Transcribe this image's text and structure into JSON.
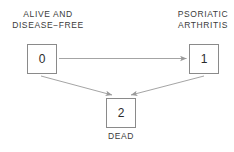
{
  "diagram": {
    "background_color": "#ffffff",
    "box_border_color": "#8a8a8a",
    "text_color": "#3a3a3a",
    "arrow_color": "#9a9a9a",
    "states": [
      {
        "id": "0",
        "number": "0",
        "label_line1": "ALIVE  AND",
        "label_line2": "DISEASE−FREE"
      },
      {
        "id": "1",
        "number": "1",
        "label_line1": "PSORIATIC",
        "label_line2": "ARTHRITIS"
      },
      {
        "id": "2",
        "number": "2",
        "label_line1": "DEAD",
        "label_line2": ""
      }
    ],
    "transitions": [
      {
        "from": "0",
        "to": "1",
        "kind": "horizontal-arrow"
      },
      {
        "from": "0",
        "to": "2",
        "kind": "diagonal-arrow"
      },
      {
        "from": "1",
        "to": "2",
        "kind": "diagonal-arrow"
      }
    ]
  }
}
